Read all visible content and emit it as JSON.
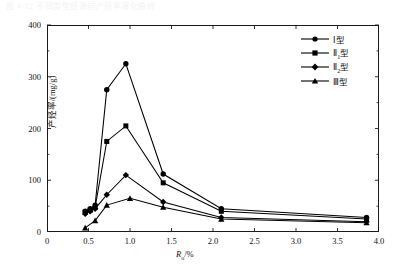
{
  "caption": {
    "text": "图 4-12 不同类型烃源岩产烃率演化曲线"
  },
  "axes": {
    "y_ticks": [
      "0",
      "100",
      "200",
      "300",
      "400"
    ],
    "x_ticks": [
      "0",
      "0.5",
      "1.0",
      "1.5",
      "2.0",
      "2.5",
      "3.0",
      "3.5",
      "4.0"
    ],
    "ylabel": "产烃率/(mg/g)",
    "xlabel_main": "R",
    "xlabel_sub": "o",
    "xlabel_unit": "/%"
  },
  "legend": {
    "position": "top-right",
    "items": [
      {
        "label": "Ⅰ型",
        "marker": "circle",
        "sub": ""
      },
      {
        "label": "Ⅱ",
        "marker": "square",
        "sub": "1",
        "suffix": "型"
      },
      {
        "label": "Ⅱ",
        "marker": "diamond",
        "sub": "2",
        "suffix": "型"
      },
      {
        "label": "Ⅲ型",
        "marker": "triangle",
        "sub": ""
      }
    ]
  },
  "chart_data": {
    "type": "line",
    "title": "",
    "xlabel": "Ro/%",
    "ylabel": "产烃率/(mg/g)",
    "xlim": [
      0,
      4.0
    ],
    "ylim": [
      0,
      400
    ],
    "grid": false,
    "legend_position": "top-right",
    "series": [
      {
        "name": "Ⅰ型",
        "marker": "circle",
        "color": "#000000",
        "x": [
          0.46,
          0.52,
          0.58,
          0.72,
          0.95,
          1.4,
          2.1,
          3.85
        ],
        "y": [
          40,
          45,
          52,
          275,
          325,
          112,
          45,
          28
        ]
      },
      {
        "name": "Ⅱ1型",
        "marker": "square",
        "color": "#000000",
        "x": [
          0.46,
          0.52,
          0.58,
          0.72,
          0.95,
          1.4,
          2.1,
          3.85
        ],
        "y": [
          38,
          42,
          48,
          175,
          205,
          95,
          40,
          25
        ]
      },
      {
        "name": "Ⅱ2型",
        "marker": "diamond",
        "color": "#000000",
        "x": [
          0.46,
          0.52,
          0.58,
          0.72,
          0.95,
          1.4,
          2.1,
          3.85
        ],
        "y": [
          35,
          40,
          45,
          72,
          110,
          58,
          28,
          20
        ]
      },
      {
        "name": "Ⅲ型",
        "marker": "triangle",
        "color": "#000000",
        "x": [
          0.46,
          0.58,
          0.72,
          1.0,
          1.4,
          2.1,
          3.85
        ],
        "y": [
          8,
          22,
          52,
          65,
          48,
          25,
          18
        ]
      }
    ]
  }
}
